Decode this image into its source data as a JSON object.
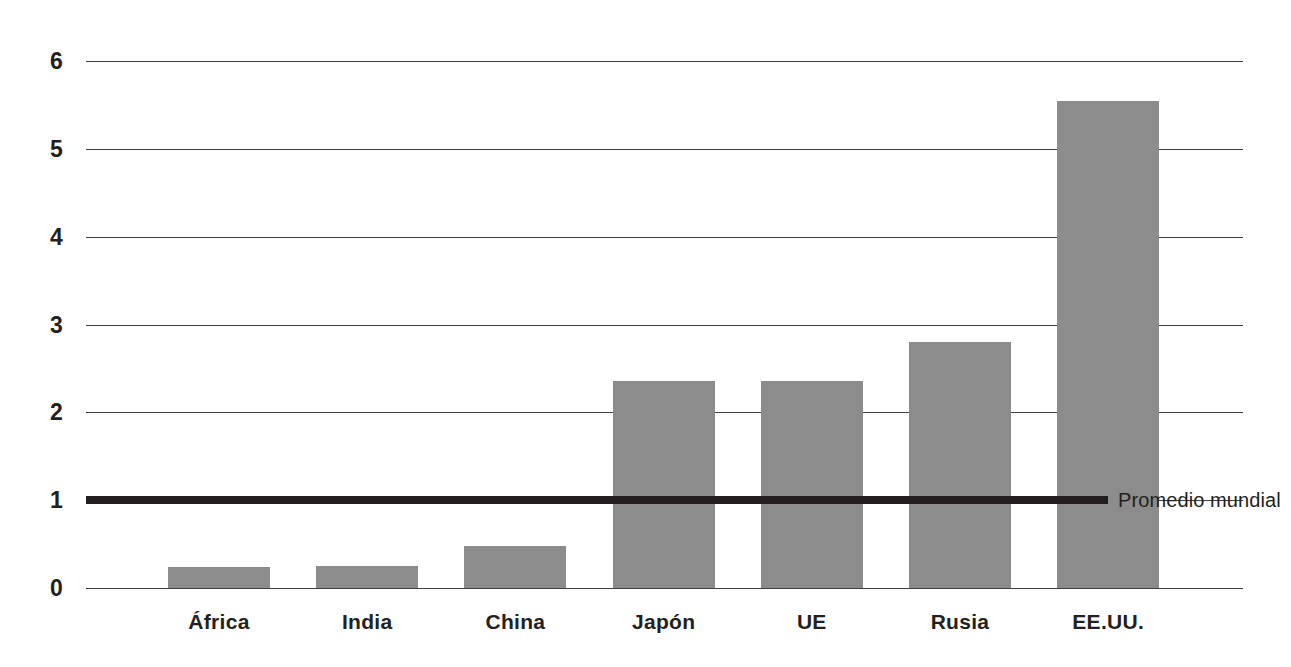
{
  "chart_data": {
    "type": "bar",
    "title": "",
    "subtitle": "",
    "xlabel": "",
    "ylabel": "",
    "categories": [
      "África",
      "India",
      "China",
      "Japón",
      "UE",
      "Rusia",
      "EE.UU."
    ],
    "values": [
      0.24,
      0.25,
      0.48,
      2.36,
      2.36,
      2.8,
      5.55
    ],
    "series": [
      {
        "name": "",
        "values": [
          0.24,
          0.25,
          0.48,
          2.36,
          2.36,
          2.8,
          5.55
        ]
      }
    ],
    "ylim": [
      0,
      6
    ],
    "yticks": [
      "0",
      "1",
      "2",
      "3",
      "4",
      "5",
      "6"
    ],
    "ytick_values": [
      0,
      1,
      2,
      3,
      4,
      5,
      6
    ],
    "grid": true,
    "legend": "none",
    "annotations": [
      {
        "name": "world-average-line",
        "label": "Promedio mundial",
        "value": 1,
        "orientation": "horizontal",
        "color": "#231f20"
      }
    ],
    "colors": {
      "bar_fill": "#8c8c8c",
      "axis": "#3f3f3f",
      "text": "#231f20",
      "background": "#ffffff",
      "annotation": "#231f20"
    }
  }
}
